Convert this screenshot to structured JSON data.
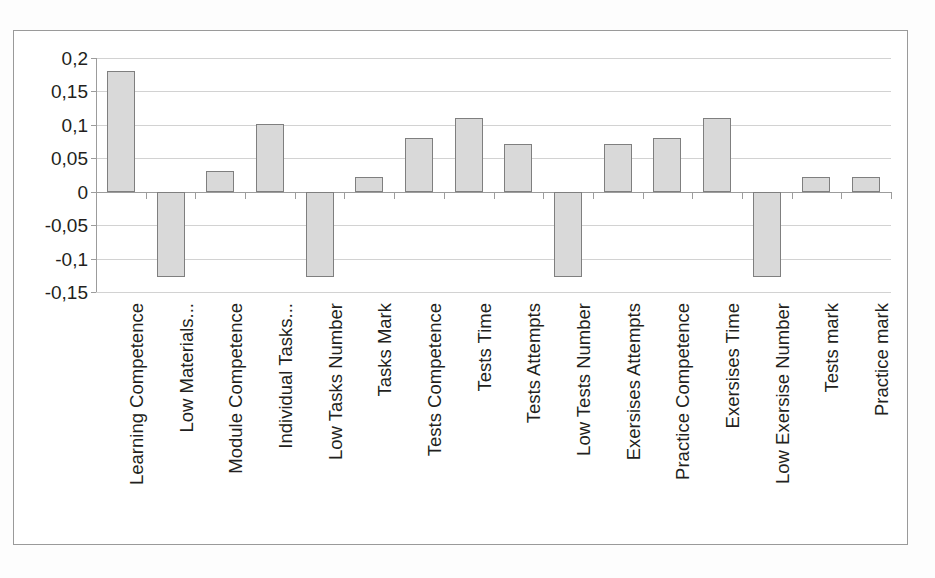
{
  "chart_data": {
    "type": "bar",
    "title": "",
    "subtitle": "",
    "xlabel": "",
    "ylabel": "",
    "ylim": [
      -0.15,
      0.2
    ],
    "ytick_labels": [
      "0,2",
      "0,15",
      "0,1",
      "0,05",
      "0",
      "-0,05",
      "-0,1",
      "-0,15"
    ],
    "ytick_values": [
      0.2,
      0.15,
      0.1,
      0.05,
      0,
      -0.05,
      -0.1,
      -0.15
    ],
    "grid": true,
    "legend": false,
    "legend_position": "none",
    "decimal_separator": ",",
    "bar_fill_color": "#d9d9d9",
    "bar_edge_color": "#7f7f7f",
    "gridline_color": "#d2d2d2",
    "axis_color": "#9c9c9c",
    "categories": [
      "Learning Competence",
      "Low Materials...",
      "Module Competence",
      "Individual Tasks...",
      "Low Tasks Number",
      "Tasks Mark",
      "Tests Competence",
      "Tests Time",
      "Tests Attempts",
      "Low Tests Number",
      "Exersises Attempts",
      "Practice Competence",
      "Exersises Time",
      "Low Exersise Number",
      "Tests mark",
      "Practice mark"
    ],
    "values": [
      0.18,
      -0.128,
      0.031,
      0.101,
      -0.128,
      0.022,
      0.081,
      0.111,
      0.072,
      -0.128,
      0.072,
      0.081,
      0.111,
      -0.128,
      0.022,
      0.022
    ],
    "series": [
      {
        "name": "",
        "values": [
          0.18,
          -0.128,
          0.031,
          0.101,
          -0.128,
          0.022,
          0.081,
          0.111,
          0.072,
          -0.128,
          0.072,
          0.081,
          0.111,
          -0.128,
          0.022,
          0.022
        ]
      }
    ]
  }
}
